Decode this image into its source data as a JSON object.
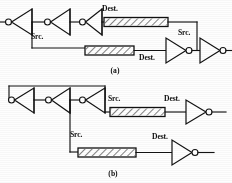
{
  "figure": {
    "background_color": "#fefefe",
    "ink_color": "#121212",
    "panels": [
      {
        "id": "a",
        "caption": "(a)",
        "caption_x": 115,
        "caption_y": 73,
        "description": "Inverter chain driving two hatched delay elements with Src. and Dest. annotations",
        "labels": [
          {
            "text": "Dest.",
            "x": 102,
            "y": 11,
            "name": "label-dest-upper-a"
          },
          {
            "text": "Src.",
            "x": 31,
            "y": 39,
            "name": "label-src-lower-a"
          },
          {
            "text": "Src.",
            "x": 178,
            "y": 35,
            "name": "label-src-right-a"
          },
          {
            "text": "Dest.",
            "x": 139,
            "y": 60,
            "name": "label-dest-lower-a"
          }
        ],
        "inverters": [
          {
            "name": "inverter-a1",
            "dir": "left",
            "x": 14,
            "y": 22,
            "w": 26,
            "h": 26
          },
          {
            "name": "inverter-a2",
            "dir": "left",
            "x": 52,
            "y": 22,
            "w": 26,
            "h": 26
          },
          {
            "name": "inverter-a3",
            "dir": "left",
            "x": 86,
            "y": 22,
            "w": 26,
            "h": 26
          },
          {
            "name": "inverter-a4",
            "dir": "right",
            "x": 160,
            "y": 50,
            "w": 26,
            "h": 26
          },
          {
            "name": "inverter-a5",
            "dir": "right",
            "x": 196,
            "y": 50,
            "w": 26,
            "h": 26
          }
        ],
        "delay_boxes": [
          {
            "name": "delay-box-a-upper",
            "x": 104,
            "y": 17,
            "w": 64,
            "h": 9
          },
          {
            "name": "delay-box-a-lower",
            "x": 85,
            "y": 46,
            "w": 49,
            "h": 9
          }
        ]
      },
      {
        "id": "b",
        "caption": "(b)",
        "caption_x": 113,
        "caption_y": 176,
        "description": "Inverter ring with feedback loop driving two hatched delay elements",
        "labels": [
          {
            "text": "Src.",
            "x": 108,
            "y": 101,
            "name": "label-src-upper-b"
          },
          {
            "text": "Dest.",
            "x": 164,
            "y": 101,
            "name": "label-dest-upper-b"
          },
          {
            "text": "Src.",
            "x": 70,
            "y": 137,
            "name": "label-src-lower-b"
          },
          {
            "text": "Dest.",
            "x": 152,
            "y": 139,
            "name": "label-dest-lower-b"
          }
        ],
        "inverters": [
          {
            "name": "inverter-b1",
            "dir": "left",
            "x": 16,
            "y": 100,
            "w": 26,
            "h": 26
          },
          {
            "name": "inverter-b2",
            "dir": "left",
            "x": 52,
            "y": 100,
            "w": 26,
            "h": 26
          },
          {
            "name": "inverter-b3",
            "dir": "left",
            "x": 86,
            "y": 100,
            "w": 26,
            "h": 26
          },
          {
            "name": "inverter-b4",
            "dir": "right",
            "x": 186,
            "y": 100,
            "w": 26,
            "h": 26
          },
          {
            "name": "inverter-b5",
            "dir": "right",
            "x": 172,
            "y": 140,
            "w": 26,
            "h": 26
          }
        ],
        "delay_boxes": [
          {
            "name": "delay-box-b-upper",
            "x": 110,
            "y": 108,
            "w": 55,
            "h": 9
          },
          {
            "name": "delay-box-b-lower",
            "x": 78,
            "y": 148,
            "w": 58,
            "h": 9
          }
        ]
      }
    ]
  }
}
